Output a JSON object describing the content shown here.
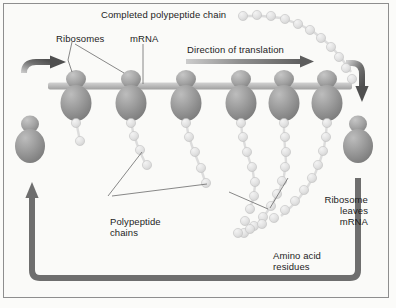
{
  "figure": {
    "background_color": "#fafaf8",
    "border_color": "#8e8e8e",
    "ribosome_color": "#8f8f8f",
    "mrna_color": "#b9b9b9",
    "bead_color": "#e3e3e3",
    "arrow_color": "#6e6e6e",
    "text_color": "#1d1d1d"
  },
  "labels": {
    "completed_chain": "Completed polypeptide chain",
    "ribosomes": "Ribosomes",
    "mrna": "mRNA",
    "direction": "Direction of translation",
    "polypeptide_chains_line1": "Polypeptide",
    "polypeptide_chains_line2": "chains",
    "amino_acid_line1": "Amino acid",
    "amino_acid_line2": "residues",
    "ribosome_leaves_line1": "Ribosome",
    "ribosome_leaves_line2": "leaves",
    "ribosome_leaves_line3": "mRNA"
  },
  "diagram_data": {
    "type": "diagram",
    "subject": "translation of mRNA by a polyribosome",
    "mrna_strand": {
      "x_start": 48,
      "x_end": 352,
      "y": 86,
      "thickness": 7
    },
    "bound_ribosomes": [
      {
        "index": 1,
        "x": 76,
        "chain_beads": 2
      },
      {
        "index": 2,
        "x": 131,
        "chain_beads": 4
      },
      {
        "index": 3,
        "x": 186,
        "chain_beads": 5
      },
      {
        "index": 4,
        "x": 241,
        "chain_beads": 8
      },
      {
        "index": 5,
        "x": 284,
        "chain_beads": 10
      },
      {
        "index": 6,
        "x": 327,
        "chain_beads": 12
      }
    ],
    "free_ribosome_entering": {
      "x": 30,
      "y": 140
    },
    "free_ribosome_leaving": {
      "x": 358,
      "y": 140
    },
    "completed_chain_beads": 13,
    "recycling_path": "ribosome leaves mRNA at right, travels down and around to left, re-enters mRNA at left end",
    "direction_of_translation": "left to right"
  }
}
